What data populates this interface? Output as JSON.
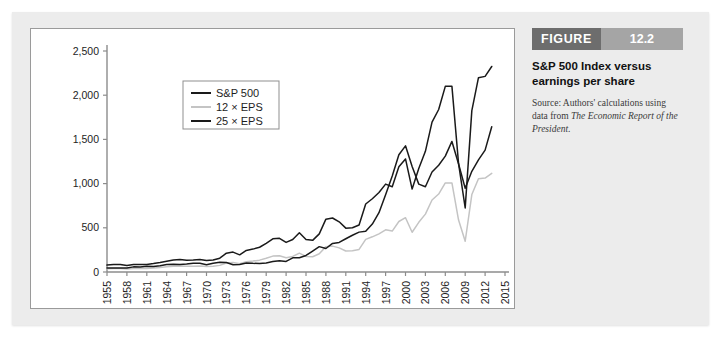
{
  "figure": {
    "banner_word": "FIGURE",
    "banner_number": "12.2",
    "title": "S&P 500 Index versus earnings per share",
    "source_prefix": "Source: Authors' calculations using data from ",
    "source_italic": "The Economic Report of the President",
    "source_suffix": "."
  },
  "colors": {
    "panel_bg": "#ececec",
    "card_bg": "#ffffff",
    "card_border": "#9a9a9a",
    "banner_dark": "#6d6d6d",
    "banner_light": "#a5a5a5",
    "axis": "#8c8c8c",
    "sp500": "#1a1a1a",
    "eps12": "#c4c4c4",
    "eps25": "#1a1a1a"
  },
  "chart_data": {
    "type": "line",
    "title": "S&P 500 Index versus earnings per share",
    "xlabel": "",
    "ylabel": "",
    "grid": false,
    "legend_position": "top-left-inside",
    "xlim": [
      1955,
      2015
    ],
    "ylim": [
      0,
      2500
    ],
    "yticks": [
      0,
      500,
      1000,
      1500,
      2000,
      2500
    ],
    "ytick_labels": [
      "0",
      "500",
      "1,000",
      "1,500",
      "2,000",
      "2,500"
    ],
    "xticks": [
      1955,
      1958,
      1961,
      1964,
      1967,
      1970,
      1973,
      1976,
      1979,
      1982,
      1985,
      1988,
      1991,
      1994,
      1997,
      2000,
      2003,
      2006,
      2009,
      2012,
      2015
    ],
    "xtick_labels": [
      "1955",
      "1958",
      "1961",
      "1964",
      "1967",
      "1970",
      "1973",
      "1976",
      "1979",
      "1982",
      "1985",
      "1988",
      "1991",
      "1994",
      "1997",
      "2000",
      "2003",
      "2006",
      "2009",
      "2012",
      "2015"
    ],
    "x": [
      1955,
      1956,
      1957,
      1958,
      1959,
      1960,
      1961,
      1962,
      1963,
      1964,
      1965,
      1966,
      1967,
      1968,
      1969,
      1970,
      1971,
      1972,
      1973,
      1974,
      1975,
      1976,
      1977,
      1978,
      1979,
      1980,
      1981,
      1982,
      1983,
      1984,
      1985,
      1986,
      1987,
      1988,
      1989,
      1990,
      1991,
      1992,
      1993,
      1994,
      1995,
      1996,
      1997,
      1998,
      1999,
      2000,
      2001,
      2002,
      2003,
      2004,
      2005,
      2006,
      2007,
      2008,
      2009,
      2010,
      2011,
      2012,
      2013
    ],
    "series": [
      {
        "name": "S&P 500",
        "color": "#1a1a1a",
        "values": [
          45,
          46,
          45,
          46,
          58,
          56,
          66,
          62,
          70,
          84,
          88,
          85,
          91,
          99,
          98,
          83,
          98,
          109,
          107,
          82,
          86,
          102,
          98,
          96,
          103,
          118,
          128,
          120,
          160,
          161,
          187,
          236,
          287,
          266,
          323,
          334,
          376,
          416,
          451,
          460,
          542,
          671,
          873,
          1085,
          1327,
          1427,
          1194,
          994,
          965,
          1131,
          1207,
          1311,
          1477,
          1221,
          948,
          1139,
          1268,
          1379,
          1643
        ],
        "label_points": []
      },
      {
        "name": "12 × EPS",
        "color": "#c4c4c4",
        "values": [
          37,
          41,
          41,
          35,
          41,
          41,
          41,
          46,
          51,
          58,
          65,
          68,
          64,
          65,
          68,
          62,
          65,
          75,
          102,
          108,
          93,
          117,
          124,
          134,
          156,
          180,
          183,
          161,
          176,
          213,
          176,
          172,
          207,
          287,
          293,
          273,
          238,
          240,
          255,
          369,
          398,
          432,
          477,
          463,
          571,
          614,
          450,
          562,
          655,
          814,
          882,
          1008,
          1008,
          588,
          348,
          876,
          1055,
          1062,
          1116
        ],
        "label_points": []
      },
      {
        "name": "25 × EPS",
        "color": "#1a1a1a",
        "values": [
          78,
          85,
          85,
          73,
          85,
          85,
          85,
          95,
          107,
          121,
          135,
          142,
          133,
          136,
          141,
          129,
          136,
          156,
          213,
          225,
          194,
          244,
          259,
          280,
          325,
          375,
          381,
          335,
          367,
          444,
          367,
          358,
          431,
          598,
          611,
          568,
          496,
          500,
          531,
          769,
          829,
          900,
          994,
          965,
          1190,
          1279,
          938,
          1171,
          1365,
          1696,
          1838,
          2100,
          2100,
          1225,
          725,
          1825,
          2198,
          2213,
          2325
        ],
        "label_points": []
      }
    ],
    "legend": [
      {
        "label": "S&P 500",
        "color": "#1a1a1a"
      },
      {
        "label": "12 × EPS",
        "color": "#c4c4c4"
      },
      {
        "label": "25 × EPS",
        "color": "#1a1a1a"
      }
    ]
  }
}
